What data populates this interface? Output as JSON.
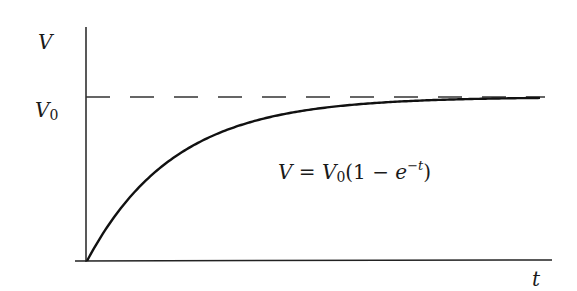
{
  "chart_data": {
    "type": "line",
    "title": "",
    "xlabel": "t",
    "ylabel": "V",
    "asymptote_label": "V",
    "asymptote_subscript": "0",
    "annotation": {
      "lhs": "V",
      "equals": " = ",
      "v": "V",
      "v_sub": "0",
      "open": "(1 − ",
      "e": "e",
      "exp": "−t",
      "close": ")"
    },
    "function": "V = V0(1 - e^(-t))",
    "series": [
      {
        "name": "V(t)",
        "x": [
          0,
          0.5,
          1,
          1.5,
          2,
          2.5,
          3,
          3.5,
          4,
          4.5,
          5
        ],
        "y": [
          0,
          0.393,
          0.632,
          0.777,
          0.865,
          0.918,
          0.95,
          0.97,
          0.982,
          0.989,
          0.993
        ]
      }
    ],
    "asymptote": {
      "y": 1,
      "style": "dashed",
      "label": "V0"
    },
    "xlim": [
      0,
      5.2
    ],
    "ylim": [
      0,
      1.4
    ],
    "grid": false,
    "ticks": "none",
    "legend": "none"
  }
}
